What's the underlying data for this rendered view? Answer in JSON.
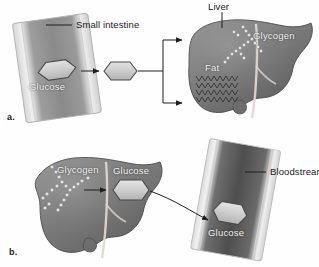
{
  "figure": {
    "ink_color": "#1a1a1a",
    "label_light_color": "#f2f2f2",
    "organ_fill": "#7c7c7c",
    "organ_shade": "#5a5a5a",
    "vessel_fill": "#d9d9d9",
    "molecule_fill": "#c9c9c9",
    "background": "#ffffff"
  },
  "panel_a": {
    "letter": "a.",
    "labels": {
      "small_intestine": "Small intestine",
      "glucose_intestine": "Glucose",
      "liver": "Liver",
      "glycogen": "Glycogen",
      "fat": "Fat"
    },
    "icons": {
      "tube": "small-intestine-tube",
      "molecule": "glucose-hexagon",
      "organ": "liver-silhouette",
      "storage": "glycogen-chain",
      "lipid": "fat-zigzag"
    },
    "flow": {
      "from": "Small intestine",
      "via": "Glucose",
      "to": "Liver",
      "branches": [
        "Glycogen",
        "Fat"
      ]
    }
  },
  "panel_b": {
    "letter": "b.",
    "labels": {
      "glycogen": "Glycogen",
      "glucose_liver": "Glucose",
      "bloodstream": "Bloodstream",
      "glucose_blood": "Glucose"
    },
    "icons": {
      "organ": "liver-silhouette",
      "storage": "glycogen-chain",
      "molecule": "glucose-hexagon",
      "vessel": "bloodstream-tube"
    },
    "flow": {
      "from": "Glycogen",
      "via": "Glucose",
      "to": "Bloodstream"
    }
  }
}
